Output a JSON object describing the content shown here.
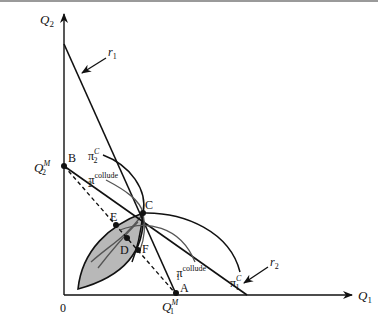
{
  "diagram": {
    "axes": {
      "x_label": "Q",
      "x_sub": "1",
      "y_label": "Q",
      "y_sub": "2",
      "origin_label": "0"
    },
    "axis_ticks": {
      "q1m_label": "Q",
      "q1m_sup": "M",
      "q1m_sub": "1",
      "q2m_label": "Q",
      "q2m_sup": "M",
      "q2m_sub": "2"
    },
    "lines": {
      "r1_label": "r",
      "r1_sub": "1",
      "r2_label": "r",
      "r2_sub": "2"
    },
    "curves": {
      "pi2c_label": "π",
      "pi2c_sub": "2",
      "pi2c_sup": "C",
      "pi2coll_label": "π",
      "pi2coll_sub": "2",
      "pi2coll_sup": "collude",
      "pi1c_label": "π",
      "pi1c_sub": "1",
      "pi1c_sup": "C",
      "pi1coll_label": "π",
      "pi1coll_sub": "1",
      "pi1coll_sup": "collude"
    },
    "points": {
      "A": "A",
      "B": "B",
      "C": "C",
      "D": "D",
      "E": "E",
      "F": "F"
    },
    "colors": {
      "line": "#111111",
      "lens_fill": "#b8b8b8",
      "collude_curve": "#555555"
    }
  }
}
